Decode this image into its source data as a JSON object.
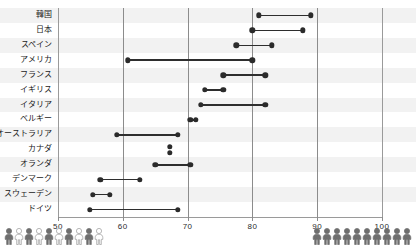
{
  "chart_data": {
    "type": "bar",
    "subtype": "dumbbell-range",
    "title": "",
    "xlabel": "",
    "ylabel": "",
    "xlim": [
      50,
      100
    ],
    "xticks": [
      50,
      60,
      70,
      80,
      90,
      100
    ],
    "xtick_labels": [
      "50",
      "60",
      "70",
      "80",
      "90",
      "100"
    ],
    "grid": true,
    "gridlines_at": [
      60,
      70,
      80,
      90
    ],
    "legend": "none",
    "categories": [
      "韓国",
      "日本",
      "スペイン",
      "アメリカ",
      "フランス",
      "イギリス",
      "イタリア",
      "ベルギー",
      "オーストラリア",
      "カナダ",
      "オランダ",
      "デンマーク",
      "スウェーデン",
      "ドイツ"
    ],
    "series": [
      {
        "name": "low",
        "values": [
          81.0,
          80.0,
          77.5,
          60.8,
          75.5,
          72.7,
          72.0,
          70.4,
          59.1,
          67.3,
          65.0,
          56.5,
          55.4,
          54.9
        ]
      },
      {
        "name": "high",
        "values": [
          89.0,
          87.8,
          83.0,
          80.0,
          82.0,
          75.5,
          82.0,
          71.3,
          68.5,
          67.3,
          70.4,
          62.6,
          58.0,
          68.5
        ]
      }
    ],
    "rows": [
      {
        "label": "韓国",
        "low": 81.0,
        "high": 89.0,
        "stacked": false
      },
      {
        "label": "日本",
        "low": 80.0,
        "high": 87.8,
        "stacked": false
      },
      {
        "label": "スペイン",
        "low": 77.5,
        "high": 83.0,
        "stacked": false
      },
      {
        "label": "アメリカ",
        "low": 60.8,
        "high": 80.0,
        "stacked": false
      },
      {
        "label": "フランス",
        "low": 75.5,
        "high": 82.0,
        "stacked": false
      },
      {
        "label": "イギリス",
        "low": 72.7,
        "high": 75.5,
        "stacked": false
      },
      {
        "label": "イタリア",
        "low": 72.0,
        "high": 82.0,
        "stacked": false
      },
      {
        "label": "ベルギー",
        "low": 70.4,
        "high": 71.3,
        "stacked": false
      },
      {
        "label": "オーストラリア",
        "low": 59.1,
        "high": 68.5,
        "stacked": false
      },
      {
        "label": "カナダ",
        "low": 67.3,
        "high": 67.3,
        "stacked": true
      },
      {
        "label": "オランダ",
        "low": 65.0,
        "high": 70.4,
        "stacked": false
      },
      {
        "label": "デンマーク",
        "low": 56.5,
        "high": 62.6,
        "stacked": false
      },
      {
        "label": "スウェーデン",
        "low": 55.4,
        "high": 58.0,
        "stacked": false
      },
      {
        "label": "ドイツ",
        "low": 54.9,
        "high": 68.5,
        "stacked": false
      }
    ],
    "colors": {
      "dot": "#2b2b2b",
      "connector": "#2e2e2e",
      "band": "#f2f2f2",
      "band_alt": "#ffffff",
      "grid": "#8c8c8c",
      "axis": "#9a9a9a",
      "text": "#1a1a1a",
      "pictogram_filled": "#6f6f6f",
      "pictogram_outline": "#ffffff"
    }
  },
  "pictograms": {
    "left": {
      "count": 10,
      "pattern": [
        "filled",
        "outline",
        "filled",
        "outline",
        "filled",
        "outline",
        "filled",
        "outline",
        "filled",
        "outline"
      ],
      "icon": "person-icon"
    },
    "right": {
      "count": 10,
      "pattern": [
        "filled",
        "filled",
        "filled",
        "filled",
        "filled",
        "filled",
        "filled",
        "filled",
        "filled",
        "filled"
      ],
      "icon": "person-icon"
    }
  }
}
